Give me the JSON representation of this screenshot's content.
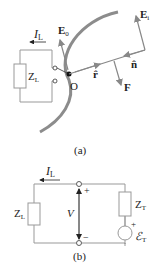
{
  "figure_a": {
    "caption": "(a)",
    "labels": {
      "current": "I",
      "current_sub": "L",
      "load": "Z",
      "load_sub": "L",
      "e0": "E",
      "e0_sub": "0",
      "ei": "E",
      "ei_sub": "i",
      "n_hat": "n̂",
      "r_hat": "r̂",
      "force": "F",
      "origin": "O"
    }
  },
  "figure_b": {
    "caption": "(b)",
    "labels": {
      "current": "I",
      "current_sub": "L",
      "load": "Z",
      "load_sub": "L",
      "voltage": "V",
      "plus": "+",
      "minus": "−",
      "thevenin_z": "Z",
      "thevenin_z_sub": "T",
      "source_plus": "+",
      "emf": "ℰ",
      "emf_sub": "T"
    }
  },
  "colors": {
    "line": "#999999",
    "surface": "#8c8c8c",
    "text": "#222222",
    "dark": "#111111"
  }
}
